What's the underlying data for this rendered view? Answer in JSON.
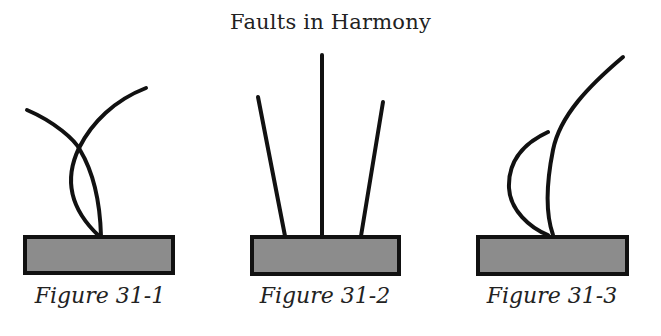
{
  "title": "Faults in Harmony",
  "colors": {
    "stroke": "#111111",
    "base_fill": "#8c8c8c",
    "background": "#ffffff"
  },
  "figures": [
    {
      "caption": "Figure 31-1",
      "description": "Two curved lines crossing and meeting at the base"
    },
    {
      "caption": "Figure 31-2",
      "description": "Three straight lines rising from the base, center vertical"
    },
    {
      "caption": "Figure 31-3",
      "description": "Two curved lines rising from the base, one taller"
    }
  ]
}
